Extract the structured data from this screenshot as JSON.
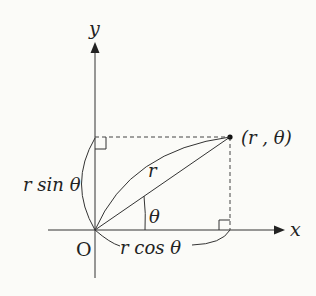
{
  "diagram": {
    "axes": {
      "x_label": "x",
      "y_label": "y",
      "origin_label": "O"
    },
    "point_label": "(r , θ)",
    "radius_label": "r",
    "angle_label": "θ",
    "vertical_component_label": "r sin θ",
    "horizontal_component_label": "r cos θ",
    "colors": {
      "stroke": "#333333",
      "background": "#fbfbf8"
    }
  }
}
